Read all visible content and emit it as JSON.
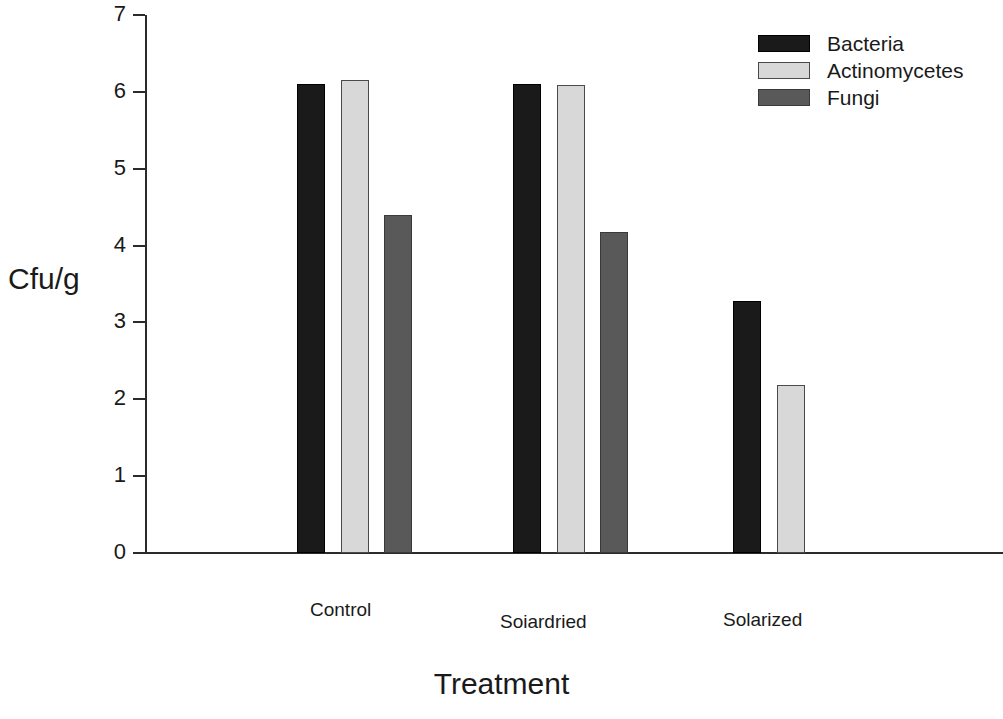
{
  "chart_data": {
    "type": "bar",
    "title": "",
    "xlabel": "Treatment",
    "ylabel": "Cfu/g",
    "categories": [
      "Control",
      "Soiardried",
      "Solarized"
    ],
    "series": [
      {
        "name": "Bacteria",
        "color": "#1a1a1a",
        "values": [
          6.1,
          6.1,
          3.28
        ]
      },
      {
        "name": "Actinomycetes",
        "color": "#d8d8d8",
        "values": [
          6.15,
          6.09,
          2.18
        ]
      },
      {
        "name": "Fungi",
        "color": "#595959",
        "values": [
          4.4,
          4.18,
          null
        ]
      }
    ],
    "ylim": [
      0,
      7
    ],
    "yticks": [
      "0",
      "1",
      "2",
      "3",
      "4",
      "5",
      "6",
      "7"
    ],
    "ytick_values": [
      0,
      1,
      2,
      3,
      4,
      5,
      6,
      7
    ],
    "grid": false,
    "legend_position": "top-right",
    "axis_color": "#2b2b2b"
  },
  "legend": {
    "entries": [
      {
        "label": "Bacteria",
        "key": "bacteria"
      },
      {
        "label": "Actinomycetes",
        "key": "actinomycetes"
      },
      {
        "label": "Fungi",
        "key": "fungi"
      }
    ]
  }
}
